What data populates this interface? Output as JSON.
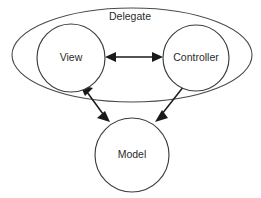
{
  "diagram": {
    "background_color": "#ffffff",
    "outline_color": "#4a4a4a",
    "connector_color": "#1a1a1a",
    "text_color": "#2b2b2b",
    "group": {
      "label": "Delegate",
      "shape": "ellipse",
      "label_x": 130,
      "label_y": 17,
      "cx": 132,
      "cy": 55,
      "rx": 120,
      "ry": 47
    },
    "nodes": [
      {
        "id": "view",
        "label": "View",
        "shape": "circle",
        "cx": 71,
        "cy": 58,
        "r": 34,
        "label_x": 71,
        "label_y": 58
      },
      {
        "id": "controller",
        "label": "Controller",
        "shape": "circle",
        "cx": 196,
        "cy": 58,
        "r": 33,
        "label_x": 196,
        "label_y": 58
      },
      {
        "id": "model",
        "label": "Model",
        "shape": "circle",
        "cx": 132,
        "cy": 155,
        "r": 37,
        "label_x": 132,
        "label_y": 155
      }
    ],
    "connectors": [
      {
        "id": "view-controller",
        "from": "view",
        "to": "controller",
        "direction": "bidirectional",
        "x1": 106,
        "y1": 57,
        "x2": 162,
        "y2": 57
      },
      {
        "id": "view-model",
        "from": "view",
        "to": "model",
        "direction": "bidirectional",
        "x1": 82,
        "y1": 87,
        "x2": 108,
        "y2": 120
      },
      {
        "id": "controller-model",
        "from": "controller",
        "to": "model",
        "direction": "unidirectional",
        "x1": 183,
        "y1": 87,
        "x2": 157,
        "y2": 120
      }
    ]
  }
}
